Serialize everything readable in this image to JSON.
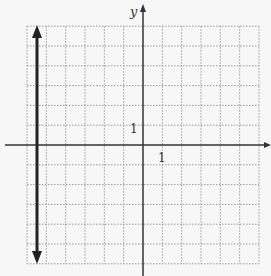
{
  "graph": {
    "y_axis_label": "y",
    "x_tick_label": "1",
    "y_tick_label": "1",
    "x_range": [
      -6,
      6
    ],
    "y_range": [
      -6,
      6
    ],
    "grid_style": "dotted",
    "colors": {
      "grid": "#9a9a9a",
      "axis": "#333333",
      "line": "#222222",
      "background": "#f7f7f7"
    }
  },
  "chart_data": {
    "type": "line",
    "title": "",
    "xlabel": "",
    "ylabel": "y",
    "xlim": [
      -6,
      6
    ],
    "ylim": [
      -6,
      6
    ],
    "grid": true,
    "series": [
      {
        "name": "vertical line x = -5.5",
        "x": [
          -5.5,
          -5.5
        ],
        "y": [
          6,
          -6
        ],
        "arrows": "both"
      }
    ],
    "tick_labels": {
      "x": [
        "1"
      ],
      "y": [
        "1"
      ]
    }
  }
}
